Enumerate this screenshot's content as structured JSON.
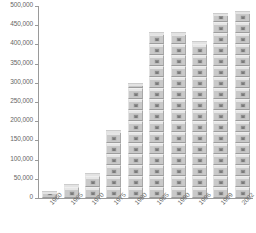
{
  "chart_data": {
    "type": "bar",
    "title": "",
    "subtitle": "",
    "xlabel": "",
    "ylabel": "",
    "grid": false,
    "legend": null,
    "categories": [
      "1960",
      "1965",
      "1970",
      "1975",
      "1980",
      "1985",
      "1990",
      "1996",
      "1999",
      "2002"
    ],
    "values": [
      18000,
      37000,
      66000,
      176000,
      300000,
      432000,
      432000,
      408000,
      482000,
      487000
    ],
    "ylim": [
      0,
      500000
    ],
    "ytick_labels": [
      "500,000",
      "450,000",
      "400,000",
      "350,000",
      "300,000",
      "250,000",
      "200,000",
      "150,000",
      "100,000",
      "50,000",
      "0"
    ],
    "ytick_values": [
      500000,
      450000,
      400000,
      350000,
      300000,
      250000,
      200000,
      150000,
      100000,
      50000,
      0
    ],
    "bar_style": "stacked-crate-picture-fill",
    "bar_color": "#c9c9c9",
    "axis_color": "#9a9a9a",
    "text_color": "#6b6b6b",
    "background_color": "#ffffff",
    "xlabel_rotation": -45
  }
}
